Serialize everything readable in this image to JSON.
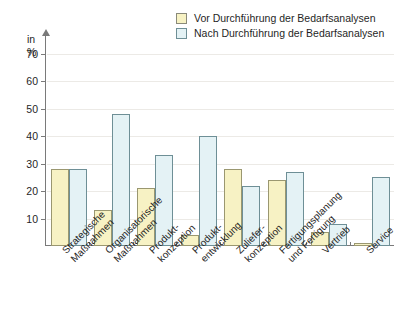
{
  "axis": {
    "unit_line1": "in",
    "unit_line2": "%",
    "y_ticks": [
      "70",
      "60",
      "50",
      "40",
      "30",
      "20",
      "10"
    ]
  },
  "legend": {
    "items": [
      {
        "label": "Vor Durchführung der Bedarfsanalysen",
        "color": "#f7f2c4",
        "key": "before"
      },
      {
        "label": "Nach Durchführung der Bedarfsanalysen",
        "color": "#e4f2f5",
        "key": "after"
      }
    ]
  },
  "categories_display": [
    "Strategische\nMaßnahmen",
    "Organisatorische\nMaßnahmen",
    "Produkt-\nkonzeption",
    "Produkt-\nentwicklung",
    "Zuliefer-\nkonzeption",
    "Fertigungsplanung\nund Fertigung",
    "Vertrieb",
    "Service"
  ],
  "chart_data": {
    "type": "bar",
    "title": "",
    "xlabel": "",
    "ylabel": "in %",
    "ylim": [
      0,
      75
    ],
    "ytick_step": 10,
    "grid": true,
    "legend_position": "top-right",
    "categories": [
      "Strategische Maßnahmen",
      "Organisatorische Maßnahmen",
      "Produkt-konzeption",
      "Produkt-entwicklung",
      "Zuliefer-konzeption",
      "Fertigungsplanung und Fertigung",
      "Vertrieb",
      "Service"
    ],
    "series": [
      {
        "name": "Vor Durchführung der Bedarfsanalysen",
        "color": "#f7f2c4",
        "values": [
          28,
          13,
          21,
          4,
          28,
          24,
          5,
          1
        ]
      },
      {
        "name": "Nach Durchführung der Bedarfsanalysen",
        "color": "#e4f2f5",
        "values": [
          28,
          48,
          33,
          40,
          22,
          27,
          8,
          25
        ]
      }
    ]
  }
}
